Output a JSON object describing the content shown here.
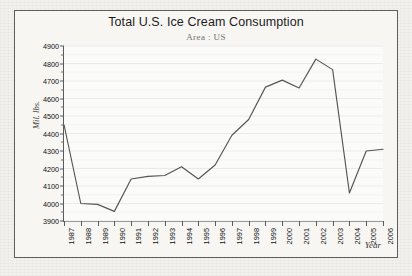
{
  "chart_data": {
    "type": "line",
    "title": "Total U.S. Ice Cream Consumption",
    "subtitle": "Area : US",
    "xlabel": "Year",
    "ylabel": "Mil. lbs.",
    "grid": true,
    "legend": false,
    "ylim": [
      3900,
      4900
    ],
    "ytick_step": 100,
    "yticks": [
      3900,
      4000,
      4100,
      4200,
      4300,
      4400,
      4500,
      4600,
      4700,
      4800,
      4900
    ],
    "ytick_labels": [
      "3900",
      "4000",
      "4100",
      "4200",
      "4300",
      "4400",
      "4500",
      "4600",
      "4700",
      "4800",
      "4900"
    ],
    "categories": [
      1987,
      1988,
      1989,
      1990,
      1991,
      1992,
      1993,
      1994,
      1995,
      1996,
      1997,
      1998,
      1999,
      2000,
      2001,
      2002,
      2003,
      2004,
      2005,
      2006
    ],
    "xtick_labels": [
      "1987",
      "1988",
      "1989",
      "1990",
      "1991",
      "1992",
      "1993",
      "1994",
      "1995",
      "1996",
      "1997",
      "1998",
      "1999",
      "2000",
      "2001",
      "2002",
      "2003",
      "2004",
      "2005",
      "2006"
    ],
    "values": [
      4450,
      4000,
      3995,
      3955,
      4140,
      4155,
      4160,
      4210,
      4140,
      4220,
      4390,
      4480,
      4665,
      4705,
      4660,
      4825,
      4765,
      4060,
      4300,
      4310
    ],
    "series": [
      {
        "name": "US",
        "color": "#555555",
        "values": [
          4450,
          4000,
          3995,
          3955,
          4140,
          4155,
          4160,
          4210,
          4140,
          4220,
          4390,
          4480,
          4665,
          4705,
          4660,
          4825,
          4765,
          4060,
          4300,
          4310
        ]
      }
    ],
    "colors": {
      "line": "#555555",
      "axis": "#5a5a5a",
      "grid": "#e9e6ee",
      "plot_background": "#fbfbfa",
      "frame_background": "#f7f6f3",
      "page_background": "#f2f1ee",
      "title_text": "#1b1b1b",
      "subtitle_text": "#707070"
    }
  }
}
